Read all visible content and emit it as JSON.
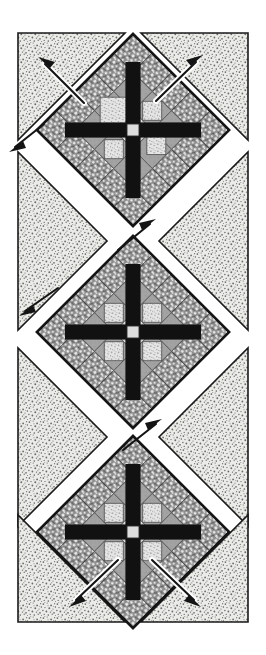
{
  "figure": {
    "title": "Quilt block assembly diagram",
    "type": "quilt-assembly-diagram",
    "width": 266,
    "height": 655,
    "background_color": "#ffffff"
  },
  "palette": {
    "white": "#ffffff",
    "off_white": "#f7f7f4",
    "outline_black": "#151515",
    "dark_patch": "#111111",
    "mid_gray": "#a0a0a0",
    "light_gray": "#d9d9d9",
    "speckle_base": "#ebebe8",
    "speckle_dot": "#6f6f6f",
    "print_base": "#8a8a8a",
    "print_dot": "#e8e8e8",
    "arrow_black": "#141414",
    "arrow_white": "#ffffff"
  },
  "blocks": [
    {
      "id": "block-top",
      "label": "Block 1",
      "center_x": 133,
      "center_y": 130,
      "half_diagonal": 96,
      "grid": 5,
      "patch_map": [
        [
          "print",
          "print",
          "print",
          "print",
          "print"
        ],
        [
          "print",
          "mid",
          "light",
          "mid",
          "print"
        ],
        [
          "print",
          "light",
          "center",
          "light",
          "print"
        ],
        [
          "print",
          "mid",
          "light",
          "mid",
          "print"
        ],
        [
          "print",
          "print",
          "print",
          "print",
          "print"
        ]
      ],
      "cross_color": "#111111",
      "cross_note": "Black diagonal sashing cross through block center"
    },
    {
      "id": "block-middle",
      "label": "Block 2",
      "center_x": 133,
      "center_y": 332,
      "half_diagonal": 96,
      "grid": 5,
      "patch_map": [
        [
          "print",
          "print",
          "print",
          "print",
          "print"
        ],
        [
          "print",
          "mid",
          "light",
          "mid",
          "print"
        ],
        [
          "print",
          "light",
          "center",
          "light",
          "print"
        ],
        [
          "print",
          "mid",
          "light",
          "mid",
          "print"
        ],
        [
          "print",
          "print",
          "print",
          "print",
          "print"
        ]
      ],
      "cross_color": "#111111",
      "cross_note": "Black diagonal sashing cross through block center"
    },
    {
      "id": "block-bottom",
      "label": "Block 3",
      "center_x": 133,
      "center_y": 532,
      "half_diagonal": 96,
      "grid": 5,
      "patch_map": [
        [
          "print",
          "print",
          "print",
          "print",
          "print"
        ],
        [
          "print",
          "mid",
          "light",
          "mid",
          "print"
        ],
        [
          "print",
          "light",
          "center",
          "light",
          "print"
        ],
        [
          "print",
          "mid",
          "light",
          "mid",
          "print"
        ],
        [
          "print",
          "print",
          "print",
          "print",
          "print"
        ]
      ],
      "cross_color": "#111111",
      "cross_note": "Black diagonal sashing cross through block center"
    }
  ],
  "setting_triangles": [
    {
      "id": "corner-top-left",
      "name": "corner-setting-triangle-top-left"
    },
    {
      "id": "corner-top-right",
      "name": "corner-setting-triangle-top-right"
    },
    {
      "id": "side-left-upper",
      "name": "side-setting-triangle-left-upper"
    },
    {
      "id": "side-right-upper",
      "name": "side-setting-triangle-right-upper"
    },
    {
      "id": "side-left-lower",
      "name": "side-setting-triangle-left-lower"
    },
    {
      "id": "side-right-lower",
      "name": "side-setting-triangle-right-lower"
    },
    {
      "id": "corner-bottom-left",
      "name": "corner-setting-triangle-bottom-left"
    },
    {
      "id": "corner-bottom-right",
      "name": "corner-setting-triangle-bottom-right"
    }
  ],
  "arrows": [
    {
      "id": "arrow-1",
      "style": "white",
      "direction": "up-left",
      "note": "Press seam toward top-left setting triangle"
    },
    {
      "id": "arrow-2",
      "style": "white",
      "direction": "up-right",
      "note": "Press seam toward top-right setting triangle"
    },
    {
      "id": "arrow-3",
      "style": "black",
      "direction": "down-left",
      "note": "Press seam down-left along sashing"
    },
    {
      "id": "arrow-4",
      "style": "black",
      "direction": "up-right",
      "note": "Press seam up-right along sashing"
    },
    {
      "id": "arrow-5",
      "style": "black",
      "direction": "down-left",
      "note": "Press seam down-left along sashing"
    },
    {
      "id": "arrow-6",
      "style": "black",
      "direction": "up-right",
      "note": "Press seam up-right along sashing"
    },
    {
      "id": "arrow-7",
      "style": "white",
      "direction": "down-left",
      "note": "Press seam toward bottom-left setting triangle"
    },
    {
      "id": "arrow-8",
      "style": "white",
      "direction": "down-right",
      "note": "Press seam toward bottom-right setting triangle"
    }
  ]
}
